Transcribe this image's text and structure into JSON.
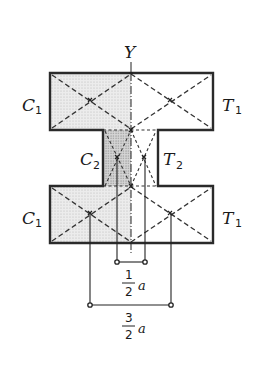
{
  "diagram": {
    "axis_label": "Y",
    "labels": {
      "top_left": {
        "main": "C",
        "sub": "1"
      },
      "top_right": {
        "main": "T",
        "sub": "1"
      },
      "web_left": {
        "main": "C",
        "sub": "2"
      },
      "web_right": {
        "main": "T",
        "sub": "2"
      },
      "bottom_left": {
        "main": "C",
        "sub": "1"
      },
      "bottom_right": {
        "main": "T",
        "sub": "1"
      }
    },
    "dimensions": {
      "inner": {
        "numerator": "1",
        "denominator": "2",
        "variable": "a"
      },
      "outer": {
        "numerator": "3",
        "denominator": "2",
        "variable": "a"
      }
    },
    "colors": {
      "outline": "#2a2a2a",
      "compression_fill": "#e6e6e6",
      "web_compression_fill": "#cfcfcf",
      "dash": "#333333"
    }
  }
}
